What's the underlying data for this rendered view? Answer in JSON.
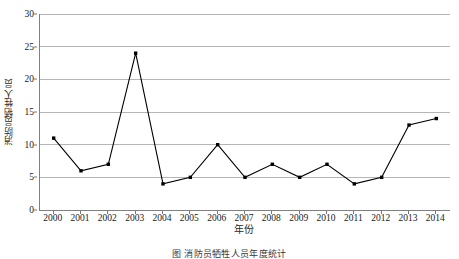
{
  "chart_data": {
    "type": "line",
    "title": "",
    "xlabel": "年份",
    "ylabel": "消防员牺牲人员",
    "categories": [
      "2000",
      "2001",
      "2002",
      "2003",
      "2004",
      "2005",
      "2006",
      "2007",
      "2008",
      "2009",
      "2010",
      "2011",
      "2012",
      "2013",
      "2014"
    ],
    "values": [
      11,
      6,
      7,
      24,
      4,
      5,
      10,
      5,
      7,
      5,
      7,
      4,
      5,
      13,
      14
    ],
    "series": [
      {
        "name": "消防员牺牲人员",
        "values": [
          11,
          6,
          7,
          24,
          4,
          5,
          10,
          5,
          7,
          5,
          7,
          4,
          5,
          13,
          14
        ]
      }
    ],
    "ylim": [
      0,
      30
    ],
    "yticks": [
      0,
      5,
      10,
      15,
      20,
      25,
      30
    ],
    "ytick_labels": [
      "0",
      "5",
      "10",
      "15",
      "20",
      "25",
      "30"
    ],
    "grid": "horizontal",
    "legend": "none",
    "marker": "filled-square",
    "line_color": "#000000",
    "marker_color": "#000000",
    "grid_color": "#b5b5b5",
    "axis_color": "#808080",
    "background": "#ffffff"
  },
  "caption": {
    "text": "图 消防员牺牲人员年度统计"
  }
}
